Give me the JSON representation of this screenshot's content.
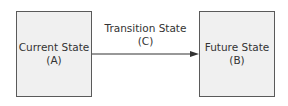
{
  "diagram": {
    "nodes": [
      {
        "id": "A",
        "title": "Current State",
        "code": "(A)"
      },
      {
        "id": "B",
        "title": "Future State",
        "code": "(B)"
      }
    ],
    "edge": {
      "from": "A",
      "to": "B",
      "title": "Transition State",
      "code": "(C)"
    }
  },
  "colors": {
    "box_fill": "#f0f0f0",
    "box_border": "#5a5a5a",
    "text": "#333333",
    "arrow": "#333333"
  }
}
